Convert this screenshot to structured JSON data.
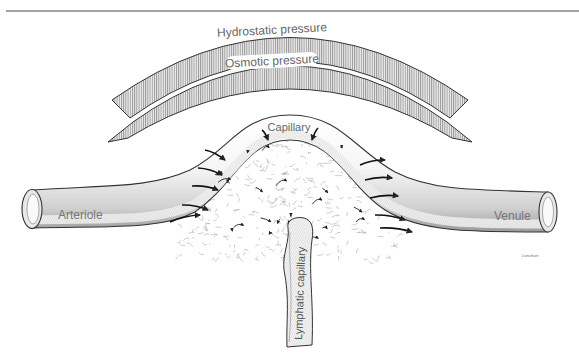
{
  "diagram": {
    "labels": {
      "hydrostatic": "Hydrostatic pressure",
      "osmotic": "Osmotic pressure",
      "capillary": "Capillary",
      "arteriole": "Arteriole",
      "venule": "Venule",
      "lymphatic": "Lymphatic capillary",
      "signature": "Lonchuet"
    },
    "colors": {
      "ink": "#333333",
      "hatch": "#8a8a8a",
      "pressure_band_fill": "#d8d8d8",
      "vessel_fill": "#f2f2f2",
      "background": "#ffffff",
      "label_text": "#666666"
    },
    "arrows": {
      "into_tissue_count": 12,
      "interstitial_count": 20
    }
  }
}
